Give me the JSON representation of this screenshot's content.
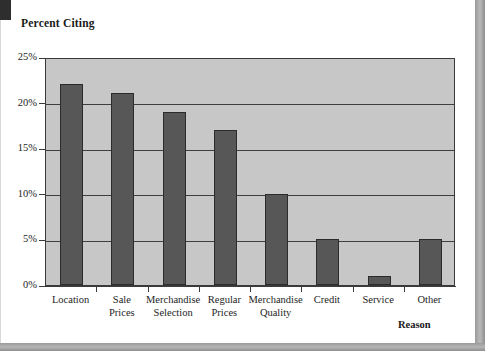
{
  "page": {
    "background_color": "#ffffff",
    "frame_color": "#9a9a9a",
    "corner_mark_color": "#2e2e2e"
  },
  "chart_data": {
    "type": "bar",
    "title": "Percent Citing",
    "xlabel": "Reason",
    "ylabel": "Percent Citing",
    "categories": [
      "Location",
      "Sale\nPrices",
      "Merchandise\nSelection",
      "Regular\nPrices",
      "Merchandise\nQuality",
      "Credit",
      "Service",
      "Other"
    ],
    "values": [
      22,
      21,
      19,
      17,
      10,
      5,
      1,
      5
    ],
    "ylim": [
      0,
      25
    ],
    "ytick_values": [
      0,
      5,
      10,
      15,
      20,
      25
    ],
    "ytick_labels": [
      "0%",
      "5%",
      "10%",
      "15%",
      "20%",
      "25%"
    ],
    "grid": true,
    "grid_axis": "y",
    "legend": "none",
    "bar_color": "#575757",
    "bar_edge_color": "#2b2b2b",
    "plot_background_color": "#c7c7c7",
    "axis_color": "#3a3a3a"
  }
}
